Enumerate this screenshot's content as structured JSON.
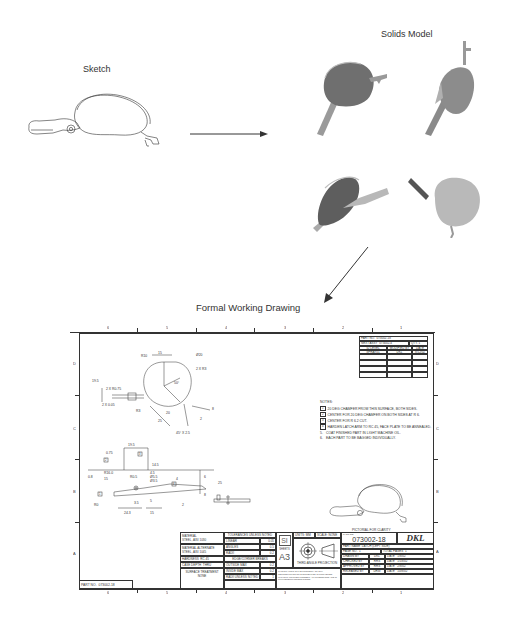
{
  "stages": {
    "sketch": {
      "title": "Sketch"
    },
    "solids": {
      "title": "Solids Model",
      "views": [
        "iso-view-1",
        "iso-view-2",
        "iso-view-3",
        "iso-view-4"
      ]
    },
    "drawing": {
      "title": "Formal Working Drawing"
    }
  },
  "colors": {
    "ink": "#333333",
    "solid_dark": "#6e6e6e",
    "solid_mid": "#8c8c8c",
    "solid_light": "#b4b4b4",
    "background": "#ffffff"
  },
  "drawing_sheet": {
    "column_labels_top": [
      "6",
      "5",
      "4",
      "3",
      "2",
      "1"
    ],
    "column_labels_bottom": [
      "6",
      "5",
      "4",
      "3",
      "2",
      "1"
    ],
    "row_labels_left": [
      "D",
      "C",
      "B",
      "A"
    ],
    "row_labels_right": [
      "D",
      "C",
      "B",
      "A"
    ],
    "revision_block": {
      "part_no_label": "PART NO.",
      "part_no": "073002-18",
      "next_assy_label": "NEXT ASSY",
      "next_assy": "073002-4",
      "qty_label": "QTY.",
      "qty": "1",
      "headers": [
        "ID LEVEL",
        "MODIFIED BY",
        "DATE"
      ],
      "rows": [
        [
          "SPRAY01",
          "DKL",
          "8/12/02"
        ],
        [
          "",
          "",
          ""
        ],
        [
          "",
          "",
          ""
        ],
        [
          "",
          "",
          ""
        ],
        [
          "",
          "",
          ""
        ]
      ]
    },
    "dimensions_top_view": [
      "R10",
      "15",
      "Ø20",
      "2 X R3",
      "19.5",
      "2 X R0.75",
      "2 X 0.05",
      "50°",
      "R3",
      "20",
      "25",
      "8",
      "2",
      "45° X 2.5"
    ],
    "dimensions_side_view": [
      "19.5",
      "0.75",
      "14.5",
      "R16.0",
      "0.8",
      "15",
      "4.5",
      "R0.5",
      "Ø5.5",
      "Ø3.5",
      "R0",
      "3.5",
      "5",
      "24.3",
      "15",
      "6",
      "8",
      "25",
      "2",
      "4"
    ],
    "note_flags": [
      "1",
      "2",
      "3",
      "4"
    ],
    "notes": {
      "title": "NOTES:",
      "items": [
        {
          "flag": "1",
          "text": "20 DEG CHAMFER FROM THIS SURFACE, BOTH SIDES."
        },
        {
          "flag": "2",
          "text": "CENTER FOR 20 DEG CHAMFER ON BOTH SIDES AT R 6."
        },
        {
          "flag": "3",
          "text": "CENTER FOR R 6.2 CUT."
        },
        {
          "flag": "4",
          "text": "HARDEN LATCH ARM TO RC 45, FACE PLATE TO BE ANNEALED."
        },
        {
          "flag": "5.",
          "text": "COAT FINISHED PART IN LIGHT MACHINE OIL."
        },
        {
          "flag": "6.",
          "text": "EACH PART TO BE BAGGED INDIVIDUALLY."
        }
      ]
    },
    "pictorial_caption": "PICTORIAL FOR CLARITY",
    "part_no_tab": {
      "label": "PART NO.",
      "value": "073002-18"
    },
    "title_block": {
      "material_label": "MATERIAL",
      "material": "STEEL, AISI 1030",
      "alt_material_label": "MATERIAL ALTERNATE",
      "alt_material": "STEEL, AISI 1045",
      "hardness_label": "HARDNESS",
      "hardness": "RC 45",
      "case_depth_label": "CASE DEPTH",
      "case_depth": "THRU",
      "surface_label": "SURFACE TREATMENT",
      "surface": "NONE",
      "tolerances_header": "TOLERANCES UNLESS NOTED",
      "tolerances": [
        {
          "label": "LINEAR",
          "sym": "±",
          "value": "0.05"
        },
        {
          "label": "ANGLES",
          "sym": "±",
          "value": "0.5"
        },
        {
          "label": "RADII",
          "sym": "±",
          "value": "0.2"
        }
      ],
      "edge_header": "EDGE/CORNER BREAKS",
      "edges": [
        {
          "label": "OUTSIDE MAX",
          "value": "0.2"
        },
        {
          "label": "INSIDE MAX",
          "value": "0.2"
        },
        {
          "label": "RADII UNLESS NOTED",
          "value": "1"
        }
      ],
      "si_label": "SI",
      "sheet_label": "SHEETS",
      "sheet_size": "A3",
      "units_label": "UNITS: MM",
      "scale_label": "SCALE: NONE",
      "projection_label": "THIRD ANGLE PROJECTION",
      "disclaimer": "THIS DRAWING IS THE PROPERTY OF DKL. REPRODUCTION OR DISTRIBUTION IS PROHIBITED WITHOUT WRITTEN CONSENT. ALL DIMENSIONS ARE IN MILLIMETERS UNLESS NOTED.",
      "part_no_label": "PART NO.",
      "part_no": "073002-18",
      "company": "DKL",
      "part_name_label": "PART NAME",
      "part_name": "LATCH (LEFT SIDE)",
      "page_no_label": "PAGE NO.",
      "page_no": "1",
      "total_pages_label": "TOTAL PAGES",
      "total_pages": "1",
      "signoffs": [
        {
          "role": "DRAWN BY",
          "who": "DKL",
          "date_label": "DATE",
          "date": "1/8/02"
        },
        {
          "role": "CHECKED BY",
          "who": "RRS",
          "date_label": "DATE",
          "date": "1/18/02"
        },
        {
          "role": "APPROVED BY",
          "who": "RRS",
          "date_label": "DATE",
          "date": "2/8/02"
        },
        {
          "role": "RELEASED BY",
          "who": "DRW",
          "date_label": "DATE",
          "date": "10/8/02"
        }
      ]
    }
  }
}
